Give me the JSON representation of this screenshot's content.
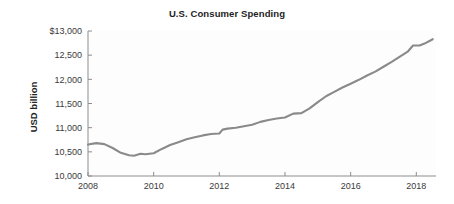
{
  "chart_data": {
    "type": "line",
    "title": "U.S. Consumer Spending",
    "xlabel": "",
    "ylabel": "USD billion",
    "xlim": [
      2008,
      2018.6
    ],
    "ylim": [
      10000,
      13000
    ],
    "grid": false,
    "legend": null,
    "line_color": "#8a8a8a",
    "axis_color": "#8d8d8d",
    "x_ticks": [
      2008,
      2010,
      2012,
      2014,
      2016,
      2018
    ],
    "x_tick_labels": [
      "2008",
      "2010",
      "2012",
      "2014",
      "2016",
      "2018"
    ],
    "y_ticks": [
      10000,
      10500,
      11000,
      11500,
      12000,
      12500,
      13000
    ],
    "y_tick_labels": [
      "10,000",
      "10,500",
      "11,000",
      "11,500",
      "12,000",
      "12,500",
      "$13,000"
    ],
    "series": [
      {
        "name": "U.S. Consumer Spending",
        "x": [
          2008.0,
          2008.25,
          2008.5,
          2008.75,
          2009.0,
          2009.25,
          2009.4,
          2009.6,
          2009.75,
          2010.0,
          2010.25,
          2010.5,
          2010.75,
          2011.0,
          2011.25,
          2011.5,
          2011.75,
          2012.0,
          2012.1,
          2012.25,
          2012.5,
          2012.75,
          2013.0,
          2013.25,
          2013.5,
          2013.75,
          2014.0,
          2014.25,
          2014.5,
          2014.75,
          2015.0,
          2015.25,
          2015.5,
          2015.75,
          2016.0,
          2016.25,
          2016.5,
          2016.75,
          2017.0,
          2017.25,
          2017.5,
          2017.75,
          2017.9,
          2018.1,
          2018.25,
          2018.5
        ],
        "y": [
          10650,
          10680,
          10660,
          10580,
          10480,
          10430,
          10420,
          10460,
          10450,
          10470,
          10560,
          10640,
          10700,
          10760,
          10800,
          10840,
          10870,
          10880,
          10960,
          10980,
          11000,
          11030,
          11060,
          11120,
          11160,
          11190,
          11210,
          11290,
          11300,
          11400,
          11530,
          11650,
          11740,
          11830,
          11910,
          11990,
          12080,
          12160,
          12260,
          12360,
          12470,
          12580,
          12700,
          12700,
          12740,
          12830
        ]
      }
    ]
  },
  "axes": {
    "title_text": "U.S. Consumer Spending",
    "ylabel_text": "USD billion"
  }
}
